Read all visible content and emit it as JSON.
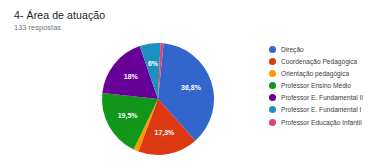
{
  "header": {
    "title": "4- Área de atuação",
    "responses": "133 respostas"
  },
  "legend": {
    "items": [
      {
        "label": "Direção",
        "color": "#3366cc"
      },
      {
        "label": "Coordenação Pedagógica",
        "color": "#dc3912"
      },
      {
        "label": "Orientação pedagógica",
        "color": "#ff9900"
      },
      {
        "label": "Professor Ensino Médio",
        "color": "#109618"
      },
      {
        "label": "Professor E. Fundamental II",
        "color": "#660099"
      },
      {
        "label": "Professor E. Fundamental I",
        "color": "#1c91c0"
      },
      {
        "label": "Professor Educação Infantil",
        "color": "#dd4477"
      }
    ]
  },
  "chart_data": {
    "type": "pie",
    "title": "4- Área de atuação",
    "subtitle": "133 respostas",
    "total_responses": 133,
    "categories": [
      "Direção",
      "Coordenação Pedagógica",
      "Orientação pedagógica",
      "Professor Ensino Médio",
      "Professor E. Fundamental II",
      "Professor E. Fundamental I",
      "Professor Educação Infantil"
    ],
    "values": [
      36.8,
      17.3,
      1.5,
      19.5,
      18,
      6,
      0.9
    ],
    "value_labels": [
      "36,8%",
      "17,3%",
      "",
      "19,5%",
      "18%",
      "6%",
      ""
    ],
    "colors": [
      "#3366cc",
      "#dc3912",
      "#ff9900",
      "#109618",
      "#660099",
      "#1c91c0",
      "#dd4477"
    ],
    "unit": "%",
    "legend_position": "right",
    "grid": false
  }
}
